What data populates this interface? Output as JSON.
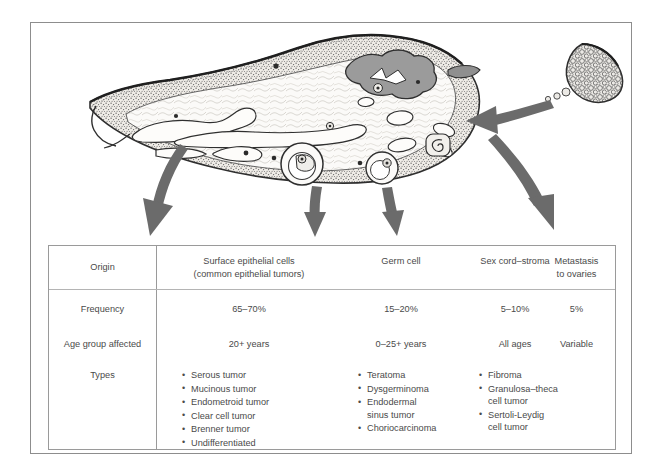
{
  "illustration": {
    "name": "ovary-cross-section-with-tumor-origin-arrows",
    "metastasis_source_label": "extra-ovarian-tumor-cell-cluster",
    "structures": [
      "germinal-epithelium",
      "tunica-albuginea",
      "ovarian-stroma",
      "corpus-luteum",
      "primordial-follicles",
      "graafian-follicle",
      "corpus-albicans",
      "atretic-follicle",
      "hilum-blood-vessels"
    ],
    "arrows": [
      {
        "name": "arrow-surface-epithelial",
        "target_column": 0
      },
      {
        "name": "arrow-germ-cell",
        "target_column": 1
      },
      {
        "name": "arrow-sex-cord-stroma",
        "target_column": 2
      },
      {
        "name": "arrow-metastasis",
        "target_column": 3
      }
    ],
    "colors": {
      "arrow_fill": "#6b6b6b",
      "stroma_fill": "#f4f2ee",
      "corpus_luteum_fill": "#9a9a9a",
      "outline": "#2f2f2f"
    }
  },
  "table": {
    "row_labels": [
      "Origin",
      "Frequency",
      "Age group affected",
      "Types"
    ],
    "columns": [
      {
        "header": "Surface epithelial cells\n(common epithelial tumors)",
        "header_line1": "Surface epithelial cells",
        "header_line2": "(common epithelial tumors)",
        "frequency": "65–70%",
        "age_group": "20+ years",
        "types": [
          "Serous tumor",
          "Mucinous tumor",
          "Endometroid tumor",
          "Clear cell tumor",
          "Brenner tumor",
          "Undifferentiated"
        ]
      },
      {
        "header": "Germ cell",
        "header_line1": "Germ cell",
        "header_line2": "",
        "frequency": "15–20%",
        "age_group": "0–25+ years",
        "types": [
          "Teratoma",
          "Dysgerminoma",
          "Endodermal\nsinus tumor",
          "Choriocarcinoma"
        ]
      },
      {
        "header": "Sex cord–stroma",
        "header_line1": "Sex cord–stroma",
        "header_line2": "",
        "frequency": "5–10%",
        "age_group": "All ages",
        "types": [
          "Fibroma",
          "Granulosa–theca\ncell tumor",
          "Sertoli-Leydig\ncell tumor"
        ]
      },
      {
        "header": "Metastasis\nto ovaries",
        "header_line1": "Metastasis",
        "header_line2": "to ovaries",
        "frequency": "5%",
        "age_group": "Variable",
        "types": []
      }
    ]
  }
}
